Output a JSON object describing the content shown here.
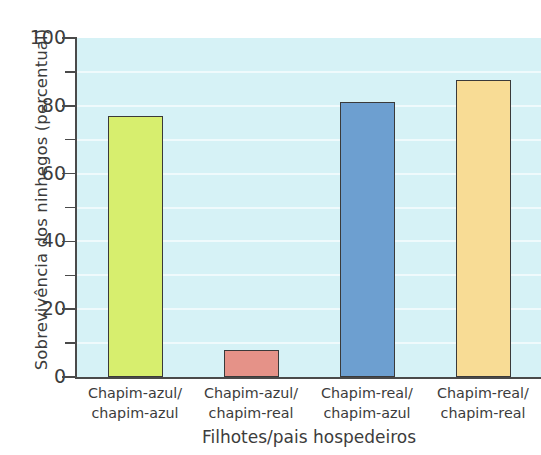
{
  "chart_data": {
    "type": "bar",
    "title": "",
    "subtitle": "",
    "xlabel": "Filhotes/pais hospedeiros",
    "ylabel": "Sobrevivência dos ninhegos (percentual)",
    "categories": [
      "Chapim-azul/ chapim-azul",
      "Chapim-azul/ chapim-real",
      "Chapim-real/ chapim-azul",
      "Chapim-real/ chapim-real"
    ],
    "category_lines": [
      [
        "Chapim-azul/",
        "chapim-azul"
      ],
      [
        "Chapim-azul/",
        "chapim-real"
      ],
      [
        "Chapim-real/",
        "chapim-azul"
      ],
      [
        "Chapim-real/",
        "chapim-real"
      ]
    ],
    "values": [
      77,
      8,
      81,
      87.5
    ],
    "bar_colors": [
      "#d7ee6e",
      "#e59288",
      "#6d9fd0",
      "#f8dc95"
    ],
    "ylim": [
      0,
      100
    ],
    "y_major_ticks": [
      0,
      20,
      40,
      60,
      80,
      100
    ],
    "y_minor_ticks": [
      10,
      30,
      50,
      70,
      90
    ],
    "y_ticklabels": [
      "0",
      "20",
      "40",
      "60",
      "80",
      "100"
    ],
    "grid": true,
    "grid_axis": "y",
    "grid_step": 10,
    "grid_color": "#ffffff",
    "legend": false,
    "legend_position": "none",
    "plot_background": "#d6f2f6",
    "axis_color": "#4a4a4a",
    "bar_edge_color": "#3a3a3a",
    "text_color": "#3c3c3c"
  }
}
